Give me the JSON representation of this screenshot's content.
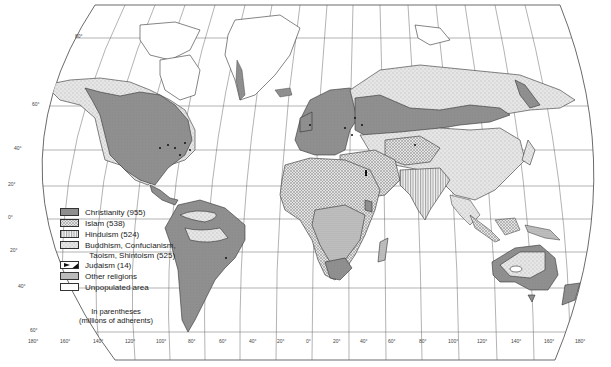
{
  "map": {
    "title": "World religions",
    "projection": "oblique world projection with curved graticule",
    "colors": {
      "christianity": "#8c8c8c",
      "islam": "#d2d2d2",
      "hinduism": "#e8e8e8",
      "buddhism": "#dedede",
      "judaism": "#111111",
      "other": "#bdbdbd",
      "unpopulated": "#ffffff",
      "grid": "#555555",
      "coast": "#333333"
    }
  },
  "legend": {
    "items": [
      {
        "label": "Christianity (955)",
        "pattern": "solid-gray",
        "adherents_millions": 955
      },
      {
        "label": "Islam (538)",
        "pattern": "crosshatch-light",
        "adherents_millions": 538
      },
      {
        "label": "Hinduism (524)",
        "pattern": "vertical-lines",
        "adherents_millions": 524
      },
      {
        "label": "Buddhism, Confucianism,\n  Taoism, Shintoism (525)",
        "pattern": "stipple-light",
        "adherents_millions": 525
      },
      {
        "label": "Judaism (14)",
        "pattern": "black-flag",
        "adherents_millions": 14
      },
      {
        "label": "Other religions",
        "pattern": "dense-dots"
      },
      {
        "label": "Unpopulated area",
        "pattern": "white"
      }
    ],
    "note_line1": "In parentheses",
    "note_line2": "(millions of adherents)"
  },
  "axes": {
    "latitude_labels": [
      "80°",
      "60°",
      "40°",
      "20°",
      "0°",
      "20°",
      "40°",
      "60°"
    ],
    "longitude_labels": [
      "180°",
      "160°",
      "140°",
      "120°",
      "100°",
      "80°",
      "60°",
      "40°",
      "20°",
      "0°",
      "20°",
      "40°",
      "60°",
      "80°",
      "100°",
      "120°",
      "140°",
      "160°",
      "180°"
    ]
  }
}
